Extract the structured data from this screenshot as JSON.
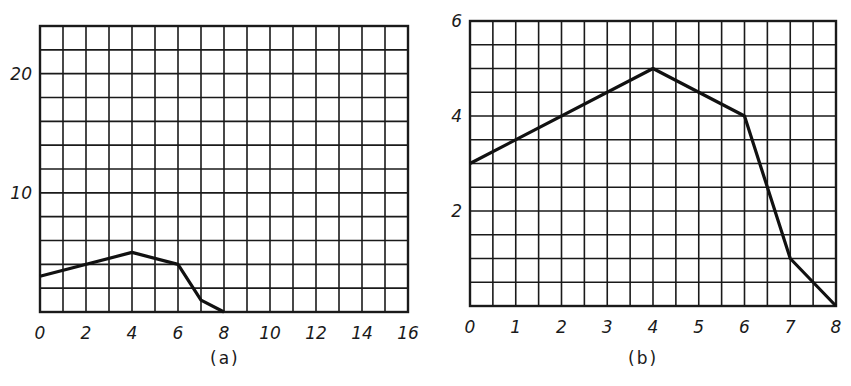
{
  "chart_data": [
    {
      "id": "a",
      "type": "line",
      "caption": "(a)",
      "title": "",
      "xlabel": "",
      "ylabel": "",
      "xlim": [
        0,
        16
      ],
      "ylim": [
        0,
        24
      ],
      "grid": true,
      "grid_x_step": 1,
      "grid_y_step": 2,
      "x_ticks": [
        0,
        2,
        4,
        6,
        8,
        10,
        12,
        14,
        16
      ],
      "x_tick_labels": [
        "0",
        "2",
        "4",
        "6",
        "8",
        "10",
        "12",
        "14",
        "16"
      ],
      "y_ticks": [
        10,
        20
      ],
      "y_tick_labels": [
        "10",
        "20"
      ],
      "series": [
        {
          "name": "curve",
          "x": [
            0,
            4,
            6,
            7,
            8
          ],
          "y": [
            3,
            5,
            4,
            1,
            0
          ]
        }
      ]
    },
    {
      "id": "b",
      "type": "line",
      "caption": "(b)",
      "title": "",
      "xlabel": "",
      "ylabel": "",
      "xlim": [
        0,
        8
      ],
      "ylim": [
        0,
        6
      ],
      "grid": true,
      "grid_x_step": 0.5,
      "grid_y_step": 0.5,
      "x_ticks": [
        0,
        1,
        2,
        3,
        4,
        5,
        6,
        7,
        8
      ],
      "x_tick_labels": [
        "0",
        "1",
        "2",
        "3",
        "4",
        "5",
        "6",
        "7",
        "8"
      ],
      "y_ticks": [
        2,
        4,
        6
      ],
      "y_tick_labels": [
        "2",
        "4",
        "6"
      ],
      "series": [
        {
          "name": "curve",
          "x": [
            0,
            4,
            6,
            7,
            8
          ],
          "y": [
            3,
            5,
            4,
            1,
            0
          ]
        }
      ]
    }
  ],
  "captions": {
    "a": "(a)",
    "b": "(b)"
  },
  "colors": {
    "grid": "#1a1a1a",
    "line": "#111111",
    "background": "#ffffff"
  }
}
